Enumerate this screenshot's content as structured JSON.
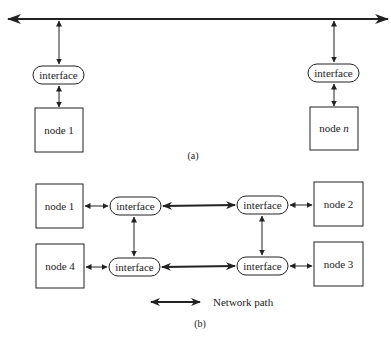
{
  "diagram_a": {
    "label": "(a)",
    "bus": {
      "type": "bidirectional-bus"
    },
    "nodes": [
      {
        "id": "node1",
        "label": "node 1",
        "label_prefix": "node ",
        "label_suffix": "1",
        "interface_label": "interface"
      },
      {
        "id": "noden",
        "label": "node n",
        "label_prefix": "node ",
        "label_suffix": "n",
        "interface_label": "interface"
      }
    ]
  },
  "diagram_b": {
    "label": "(b)",
    "nodes": [
      {
        "id": "node1",
        "label": "node 1",
        "interface_label": "interface"
      },
      {
        "id": "node2",
        "label": "node 2",
        "interface_label": "interface"
      },
      {
        "id": "node3",
        "label": "node 3",
        "interface_label": "interface"
      },
      {
        "id": "node4",
        "label": "node 4",
        "interface_label": "interface"
      }
    ],
    "links": [
      {
        "from": "interface-1",
        "to": "interface-2",
        "type": "network-path"
      },
      {
        "from": "interface-4",
        "to": "interface-3",
        "type": "network-path"
      },
      {
        "from": "interface-1",
        "to": "interface-4",
        "type": "local"
      },
      {
        "from": "interface-2",
        "to": "interface-3",
        "type": "local"
      }
    ]
  },
  "legend": {
    "network_path_label": "Network path"
  },
  "colors": {
    "stroke": "#222222",
    "background": "#ffffff"
  }
}
